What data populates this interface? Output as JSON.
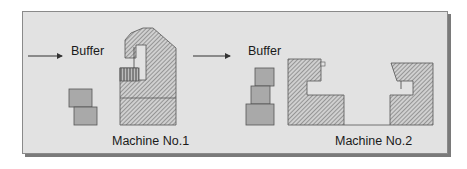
{
  "diagram": {
    "station1": {
      "buffer_label": "Buffer",
      "machine_label": "Machine No.1"
    },
    "station2": {
      "buffer_label": "Buffer",
      "machine_label": "Machine No.2"
    },
    "colors": {
      "panel_bg": "#e2e2e2",
      "panel_border": "#8a8a8a",
      "shadow": "#7a7a7a",
      "buffer_block": "#a9a9a9",
      "machine_hatch_bg": "#cfcfcf",
      "hatch_line": "#5a5a5a",
      "arrow": "#333333"
    }
  }
}
